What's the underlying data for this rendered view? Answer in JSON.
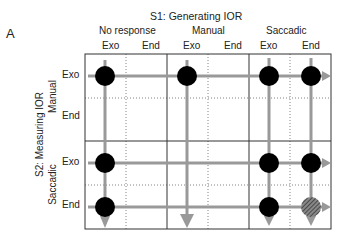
{
  "panel_label": "A",
  "s1_title": "S1: Generating IOR",
  "s2_title": "S2: Measuring IOR",
  "column_groups": [
    "No response",
    "Manual",
    "Saccadic"
  ],
  "column_sub": [
    "Exo",
    "End",
    "Exo",
    "End",
    "Exo",
    "End"
  ],
  "row_groups": [
    "Manual",
    "Saccadic"
  ],
  "row_sub": [
    "Exo",
    "End",
    "Exo",
    "End"
  ],
  "colors": {
    "arrow": "#999999",
    "dot": "#000000",
    "grid": "#333333",
    "hatched": "#555555"
  },
  "dots": [
    {
      "row": 0,
      "col": 0,
      "type": "solid"
    },
    {
      "row": 0,
      "col": 2,
      "type": "solid"
    },
    {
      "row": 0,
      "col": 4,
      "type": "solid"
    },
    {
      "row": 0,
      "col": 5,
      "type": "solid"
    },
    {
      "row": 2,
      "col": 0,
      "type": "solid"
    },
    {
      "row": 2,
      "col": 4,
      "type": "solid"
    },
    {
      "row": 2,
      "col": 5,
      "type": "solid"
    },
    {
      "row": 3,
      "col": 0,
      "type": "solid"
    },
    {
      "row": 3,
      "col": 4,
      "type": "solid"
    },
    {
      "row": 3,
      "col": 5,
      "type": "hatched"
    }
  ]
}
